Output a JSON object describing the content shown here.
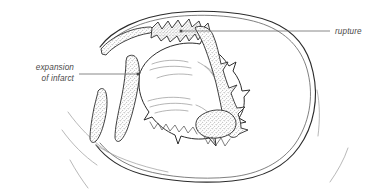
{
  "figure": {
    "background_color": "#ffffff",
    "line_color": "#2b2b2b",
    "stipple_color": "#b8b8b8",
    "label_color": "#4a4a4a",
    "leader_color": "#6b6b6b"
  },
  "annotations": [
    {
      "id": "expansion-of-infarct",
      "line1": "expansion",
      "line2": "of infarct",
      "align": "right",
      "text_x": 74,
      "text_y1": 70,
      "text_y2": 81,
      "leader_x1": 79,
      "leader_x2": 138,
      "leader_y": 74,
      "dot_x": 138,
      "dot_y": 74,
      "dot_r": 1.5
    },
    {
      "id": "rupture",
      "line1": "rupture",
      "line2": "",
      "align": "left",
      "text_x": 335,
      "text_y1": 34,
      "text_y2": 0,
      "leader_x1": 181,
      "leader_x2": 330,
      "leader_y": 31,
      "dot_x": 181,
      "dot_y": 31,
      "dot_r": 1.5
    }
  ],
  "regions": [
    {
      "id": "outer-myocardial-wall",
      "label": "outer myocardial wall"
    },
    {
      "id": "inner-myocardial-wall",
      "label": "inner myocardial wall"
    },
    {
      "id": "ventricular-cavity",
      "label": "ventricular cavity"
    },
    {
      "id": "infarct-band-upper-left",
      "label": "stippled infarct band upper left"
    },
    {
      "id": "infarct-band-left",
      "label": "stippled infarct band left"
    },
    {
      "id": "infarct-band-lower-left",
      "label": "stippled infarct band lower left"
    },
    {
      "id": "infarct-band-right",
      "label": "stippled infarct band right"
    },
    {
      "id": "infarct-patch-lower-right",
      "label": "stippled infarct patch lower right"
    },
    {
      "id": "rupture-site",
      "label": "rupture site at superior wall"
    }
  ]
}
